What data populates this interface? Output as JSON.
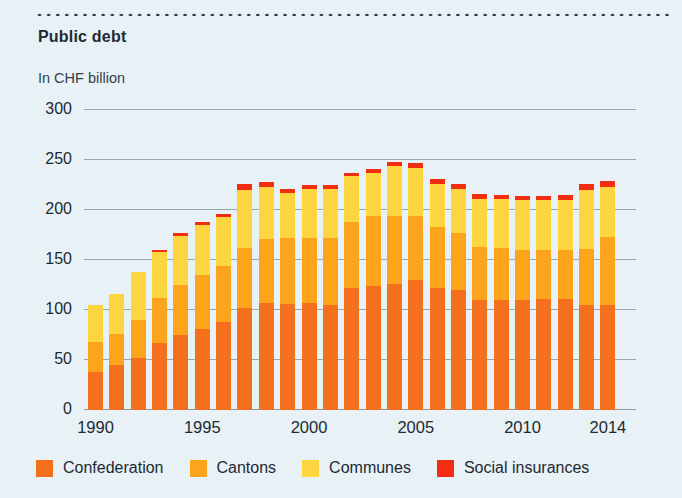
{
  "header": {
    "title": "Public debt",
    "subtitle": "In CHF billion"
  },
  "colors": {
    "background": "#e8f1f5",
    "rule": "#2b3a42",
    "grid": "#9aa7ad",
    "text": "#1d2a33",
    "confederation": "#f4701c",
    "cantons": "#fba41c",
    "communes": "#fcd541",
    "social_insurances": "#f22d12"
  },
  "chart_data": {
    "type": "bar",
    "stacked": true,
    "title": "Public debt",
    "subtitle": "In CHF billion",
    "xlabel": "",
    "ylabel": "In CHF billion",
    "ylim": [
      0,
      300
    ],
    "yticks": [
      0,
      50,
      100,
      150,
      200,
      250,
      300
    ],
    "grid": true,
    "legend_position": "bottom",
    "categories": [
      "1990",
      "1991",
      "1992",
      "1993",
      "1994",
      "1995",
      "1996",
      "1997",
      "1998",
      "1999",
      "2000",
      "2001",
      "2002",
      "2003",
      "2004",
      "2005",
      "2006",
      "2007",
      "2008",
      "2009",
      "2010",
      "2011",
      "2012",
      "2013",
      "2014"
    ],
    "xticks": [
      "1990",
      "1995",
      "2000",
      "2005",
      "2010",
      "2014"
    ],
    "xtick_indices": [
      0,
      5,
      10,
      15,
      20,
      24
    ],
    "series": [
      {
        "name": "Confederation",
        "color": "#f4701c",
        "values": [
          38,
          45,
          52,
          67,
          75,
          81,
          88,
          102,
          107,
          106,
          107,
          105,
          122,
          124,
          126,
          130,
          122,
          120,
          110,
          110,
          110,
          111,
          111,
          105,
          105
        ]
      },
      {
        "name": "Cantons",
        "color": "#fba41c",
        "values": [
          30,
          31,
          38,
          45,
          50,
          54,
          56,
          60,
          64,
          66,
          65,
          67,
          66,
          70,
          68,
          64,
          61,
          57,
          53,
          52,
          50,
          49,
          49,
          56,
          68
        ]
      },
      {
        "name": "Communes",
        "color": "#fcd541",
        "values": [
          37,
          40,
          48,
          46,
          49,
          50,
          49,
          58,
          52,
          45,
          49,
          49,
          46,
          43,
          50,
          48,
          43,
          44,
          48,
          49,
          50,
          50,
          50,
          59,
          50
        ]
      },
      {
        "name": "Social insurances",
        "color": "#f22d12",
        "values": [
          0,
          0,
          0,
          2,
          3,
          3,
          3,
          6,
          5,
          4,
          4,
          4,
          3,
          4,
          4,
          5,
          5,
          5,
          5,
          4,
          4,
          4,
          5,
          6,
          6
        ]
      }
    ]
  },
  "legend": {
    "items": [
      {
        "label": "Confederation",
        "color": "#f4701c"
      },
      {
        "label": "Cantons",
        "color": "#fba41c"
      },
      {
        "label": "Communes",
        "color": "#fcd541"
      },
      {
        "label": "Social insurances",
        "color": "#f22d12"
      }
    ]
  }
}
